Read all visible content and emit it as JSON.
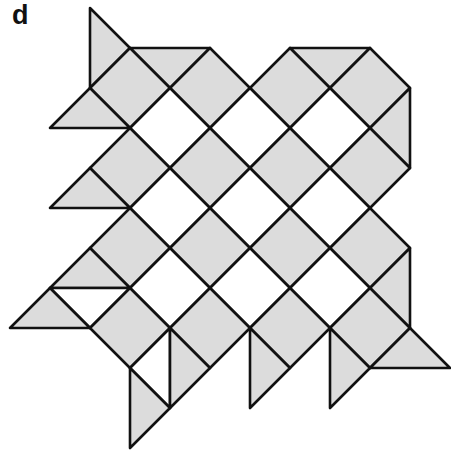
{
  "panel_label": "d",
  "colors": {
    "gray": "#dcdcdc",
    "white": "#ffffff",
    "stroke": "#111111"
  },
  "lattice": {
    "x0": 10,
    "y0": 8,
    "step": 40
  },
  "tiles": [
    {
      "shape": "triangle",
      "fill": "gray",
      "pts": [
        [
          2,
          0
        ],
        [
          3,
          1
        ],
        [
          2,
          2
        ]
      ]
    },
    {
      "shape": "triangle",
      "fill": "gray",
      "pts": [
        [
          3,
          1
        ],
        [
          5,
          1
        ],
        [
          4,
          2
        ]
      ]
    },
    {
      "shape": "triangle",
      "fill": "gray",
      "pts": [
        [
          7,
          1
        ],
        [
          9,
          1
        ],
        [
          8,
          2
        ]
      ]
    },
    {
      "shape": "diamond",
      "fill": "gray",
      "c": [
        3,
        2
      ]
    },
    {
      "shape": "diamond",
      "fill": "gray",
      "c": [
        5,
        2
      ]
    },
    {
      "shape": "diamond",
      "fill": "gray",
      "c": [
        7,
        2
      ]
    },
    {
      "shape": "diamond",
      "fill": "gray",
      "c": [
        9,
        2
      ]
    },
    {
      "shape": "triangle",
      "fill": "gray",
      "pts": [
        [
          1,
          3
        ],
        [
          2,
          2
        ],
        [
          3,
          3
        ]
      ]
    },
    {
      "shape": "diamond",
      "fill": "white",
      "c": [
        4,
        3
      ]
    },
    {
      "shape": "diamond",
      "fill": "white",
      "c": [
        6,
        3
      ]
    },
    {
      "shape": "diamond",
      "fill": "white",
      "c": [
        8,
        3
      ]
    },
    {
      "shape": "triangle",
      "fill": "gray",
      "pts": [
        [
          10,
          2
        ],
        [
          9,
          3
        ],
        [
          10,
          4
        ]
      ]
    },
    {
      "shape": "diamond",
      "fill": "gray",
      "c": [
        3,
        4
      ]
    },
    {
      "shape": "diamond",
      "fill": "gray",
      "c": [
        5,
        4
      ]
    },
    {
      "shape": "diamond",
      "fill": "gray",
      "c": [
        7,
        4
      ]
    },
    {
      "shape": "diamond",
      "fill": "gray",
      "c": [
        9,
        4
      ]
    },
    {
      "shape": "triangle",
      "fill": "gray",
      "pts": [
        [
          1,
          5
        ],
        [
          2,
          4
        ],
        [
          3,
          5
        ]
      ]
    },
    {
      "shape": "diamond",
      "fill": "white",
      "c": [
        4,
        5
      ]
    },
    {
      "shape": "diamond",
      "fill": "white",
      "c": [
        6,
        5
      ]
    },
    {
      "shape": "diamond",
      "fill": "white",
      "c": [
        8,
        5
      ]
    },
    {
      "shape": "diamond",
      "fill": "gray",
      "c": [
        3,
        6
      ]
    },
    {
      "shape": "diamond",
      "fill": "gray",
      "c": [
        5,
        6
      ]
    },
    {
      "shape": "diamond",
      "fill": "gray",
      "c": [
        7,
        6
      ]
    },
    {
      "shape": "diamond",
      "fill": "gray",
      "c": [
        9,
        6
      ]
    },
    {
      "shape": "triangle",
      "fill": "gray",
      "pts": [
        [
          1,
          7
        ],
        [
          2,
          6
        ],
        [
          3,
          7
        ]
      ]
    },
    {
      "shape": "triangle",
      "fill": "white",
      "pts": [
        [
          1,
          7
        ],
        [
          3,
          7
        ],
        [
          2,
          8
        ]
      ]
    },
    {
      "shape": "triangle",
      "fill": "gray",
      "pts": [
        [
          0,
          8
        ],
        [
          1,
          7
        ],
        [
          2,
          8
        ]
      ]
    },
    {
      "shape": "diamond",
      "fill": "white",
      "c": [
        4,
        7
      ]
    },
    {
      "shape": "diamond",
      "fill": "white",
      "c": [
        6,
        7
      ]
    },
    {
      "shape": "diamond",
      "fill": "white",
      "c": [
        8,
        7
      ]
    },
    {
      "shape": "triangle",
      "fill": "gray",
      "pts": [
        [
          10,
          6
        ],
        [
          9,
          7
        ],
        [
          10,
          8
        ]
      ]
    },
    {
      "shape": "diamond",
      "fill": "gray",
      "c": [
        3,
        8
      ]
    },
    {
      "shape": "diamond",
      "fill": "gray",
      "c": [
        5,
        8
      ]
    },
    {
      "shape": "diamond",
      "fill": "gray",
      "c": [
        7,
        8
      ]
    },
    {
      "shape": "diamond",
      "fill": "gray",
      "c": [
        9,
        8
      ]
    },
    {
      "shape": "triangle",
      "fill": "white",
      "pts": [
        [
          3,
          9
        ],
        [
          4,
          8
        ],
        [
          4,
          10
        ]
      ]
    },
    {
      "shape": "triangle",
      "fill": "gray",
      "pts": [
        [
          4,
          8
        ],
        [
          5,
          9
        ],
        [
          4,
          10
        ]
      ]
    },
    {
      "shape": "triangle",
      "fill": "gray",
      "pts": [
        [
          3,
          9
        ],
        [
          4,
          10
        ],
        [
          3,
          11
        ]
      ]
    },
    {
      "shape": "triangle",
      "fill": "gray",
      "pts": [
        [
          6,
          8
        ],
        [
          7,
          9
        ],
        [
          6,
          10
        ]
      ]
    },
    {
      "shape": "triangle",
      "fill": "gray",
      "pts": [
        [
          8,
          8
        ],
        [
          9,
          9
        ],
        [
          8,
          10
        ]
      ]
    },
    {
      "shape": "triangle",
      "fill": "gray",
      "pts": [
        [
          9,
          9
        ],
        [
          10,
          8
        ],
        [
          11,
          9
        ]
      ]
    }
  ]
}
